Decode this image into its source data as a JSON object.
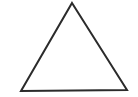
{
  "canvas": {
    "width": 138,
    "height": 97,
    "background_color": "#ffffff",
    "description": "Scanned black-and-white line drawing of a single triangle outline on a blank white field"
  },
  "figure": {
    "name": "triangle",
    "shape_type": "triangle",
    "variant": "isosceles",
    "filled": false,
    "fill_color": "none",
    "stroke_color": "#2b2b2b",
    "stroke_width": 2,
    "orientation": "apex-up",
    "vertices": [
      {
        "label": "apex",
        "x": 72,
        "y": 3
      },
      {
        "label": "bottom-right",
        "x": 127,
        "y": 90
      },
      {
        "label": "bottom-left",
        "x": 21,
        "y": 91
      }
    ],
    "points_attr": "72,3 127,90 21,91",
    "edges": [
      {
        "name": "left-edge",
        "from": "bottom-left",
        "to": "apex"
      },
      {
        "name": "right-edge",
        "from": "apex",
        "to": "bottom-right"
      },
      {
        "name": "base-edge",
        "from": "bottom-right",
        "to": "bottom-left"
      }
    ],
    "measurements": {
      "base_width_px": 106,
      "height_px": 88
    }
  },
  "annotations": {
    "has_text_labels": false,
    "has_axes": false,
    "has_legend": false,
    "label_count": 0
  }
}
